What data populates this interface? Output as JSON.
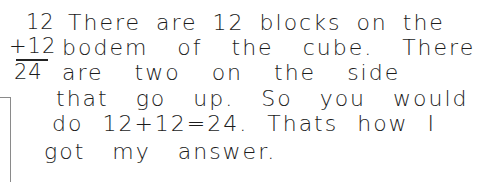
{
  "computation": {
    "addend_1": "12",
    "addend_2": "+12",
    "sum": "24"
  },
  "explanation": {
    "lines": [
      "There are 12 blocks on the",
      "bodem of the cube. There",
      "are two on the side",
      "that go up. So you would",
      "do 12+12=24. Thats how I",
      "got my answer."
    ]
  },
  "colors": {
    "ink": "#1c1c1c",
    "paper": "#ffffff",
    "margin_line": "#8a8a8a"
  }
}
